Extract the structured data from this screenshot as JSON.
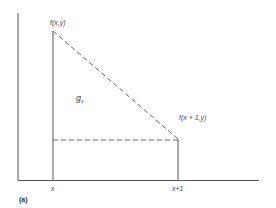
{
  "diagram": {
    "labels": {
      "peak_left": "f(x,y)",
      "area_symbol": "g",
      "area_subscript": "x",
      "peak_right": "f(x + 1,y)",
      "x_tick_left": "x",
      "x_tick_right": "x+1",
      "caption": "(a)"
    },
    "colors": {
      "line": "#555555",
      "dashed": "#666666",
      "text": "#444444"
    }
  }
}
